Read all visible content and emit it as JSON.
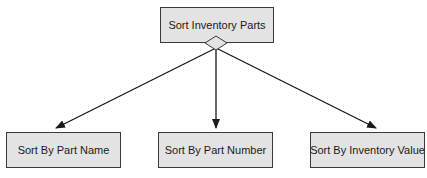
{
  "diagram": {
    "type": "hierarchy",
    "root": {
      "id": "root",
      "label": "Sort Inventory Parts"
    },
    "children": [
      {
        "id": "by-name",
        "label": "Sort By Part Name"
      },
      {
        "id": "by-number",
        "label": "Sort By Part Number"
      },
      {
        "id": "by-value",
        "label": "Sort By Inventory Value"
      }
    ],
    "connector": "diamond",
    "colors": {
      "box_fill": "#e3e3e3",
      "box_border": "#3a3a3a",
      "line": "#1a1a1a"
    }
  }
}
